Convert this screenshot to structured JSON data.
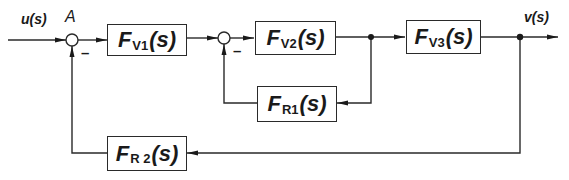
{
  "diagram": {
    "type": "control-loop block diagram",
    "signals": {
      "input": "u(s)",
      "output": "v(s)",
      "junction_label": "A",
      "minus_sign": "–"
    },
    "blocks": [
      {
        "id": "fv1",
        "letter": "F",
        "sub": "V1",
        "arg": "(s)"
      },
      {
        "id": "fv2",
        "letter": "F",
        "sub": "V2",
        "arg": "(s)"
      },
      {
        "id": "fv3",
        "letter": "F",
        "sub": "V3",
        "arg": "(s)"
      },
      {
        "id": "fr1",
        "letter": "F",
        "sub": "R1",
        "arg": "(s)"
      },
      {
        "id": "fr2",
        "letter": "F",
        "sub": "R 2",
        "arg": "(s)"
      }
    ],
    "colors": {
      "line": "#2a2a2a",
      "background": "#ffffff"
    }
  }
}
